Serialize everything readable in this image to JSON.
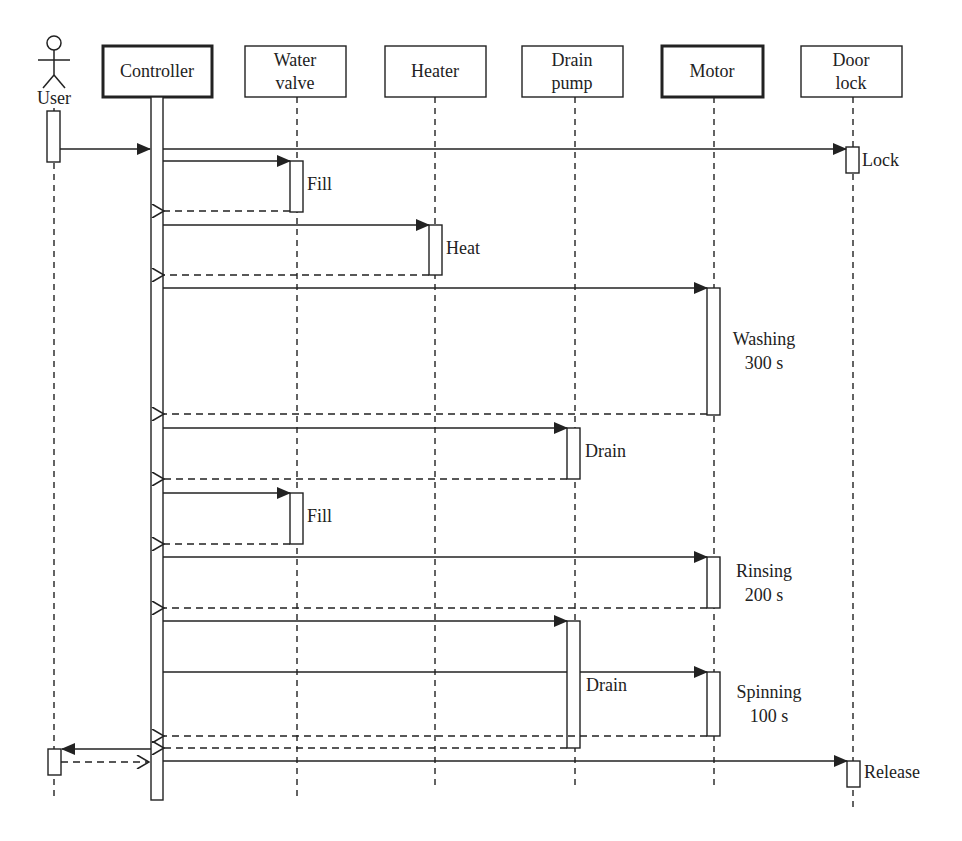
{
  "diagram": {
    "type": "uml-sequence",
    "actor": {
      "label": "User"
    },
    "lifelines": [
      {
        "id": "controller",
        "label_lines": [
          "Controller"
        ],
        "bold": true
      },
      {
        "id": "water_valve",
        "label_lines": [
          "Water",
          "valve"
        ],
        "bold": false
      },
      {
        "id": "heater",
        "label_lines": [
          "Heater"
        ],
        "bold": false
      },
      {
        "id": "drain_pump",
        "label_lines": [
          "Drain",
          "pump"
        ],
        "bold": false
      },
      {
        "id": "motor",
        "label_lines": [
          "Motor"
        ],
        "bold": true
      },
      {
        "id": "door_lock",
        "label_lines": [
          "Door",
          "lock"
        ],
        "bold": false
      }
    ],
    "activity_labels": {
      "lock": "Lock",
      "fill1": "Fill",
      "heat": "Heat",
      "washing": [
        "Washing",
        "300 s"
      ],
      "drain1": "Drain",
      "fill2": "Fill",
      "rinsing": [
        "Rinsing",
        "200 s"
      ],
      "drain2": "Drain",
      "spinning": [
        "Spinning",
        "100 s"
      ],
      "release": "Release"
    },
    "messages": [
      {
        "from": "User",
        "to": "Controller",
        "kind": "sync"
      },
      {
        "from": "Controller",
        "to": "Door lock",
        "kind": "sync",
        "label": "Lock"
      },
      {
        "from": "Controller",
        "to": "Water valve",
        "kind": "sync",
        "label": "Fill"
      },
      {
        "from": "Water valve",
        "to": "Controller",
        "kind": "return"
      },
      {
        "from": "Controller",
        "to": "Heater",
        "kind": "sync",
        "label": "Heat"
      },
      {
        "from": "Heater",
        "to": "Controller",
        "kind": "return"
      },
      {
        "from": "Controller",
        "to": "Motor",
        "kind": "sync",
        "label": "Washing 300 s"
      },
      {
        "from": "Motor",
        "to": "Controller",
        "kind": "return"
      },
      {
        "from": "Controller",
        "to": "Drain pump",
        "kind": "sync",
        "label": "Drain"
      },
      {
        "from": "Drain pump",
        "to": "Controller",
        "kind": "return"
      },
      {
        "from": "Controller",
        "to": "Water valve",
        "kind": "sync",
        "label": "Fill"
      },
      {
        "from": "Water valve",
        "to": "Controller",
        "kind": "return"
      },
      {
        "from": "Controller",
        "to": "Motor",
        "kind": "sync",
        "label": "Rinsing 200 s"
      },
      {
        "from": "Motor",
        "to": "Controller",
        "kind": "return"
      },
      {
        "from": "Controller",
        "to": "Drain pump",
        "kind": "sync",
        "label": "Drain"
      },
      {
        "from": "Controller",
        "to": "Motor",
        "kind": "sync",
        "label": "Spinning 100 s"
      },
      {
        "from": "Motor",
        "to": "Controller",
        "kind": "return"
      },
      {
        "from": "Drain pump",
        "to": "Controller",
        "kind": "return"
      },
      {
        "from": "Controller",
        "to": "User",
        "kind": "sync"
      },
      {
        "from": "User",
        "to": "Controller",
        "kind": "return"
      },
      {
        "from": "Controller",
        "to": "Door lock",
        "kind": "sync",
        "label": "Release"
      }
    ]
  }
}
